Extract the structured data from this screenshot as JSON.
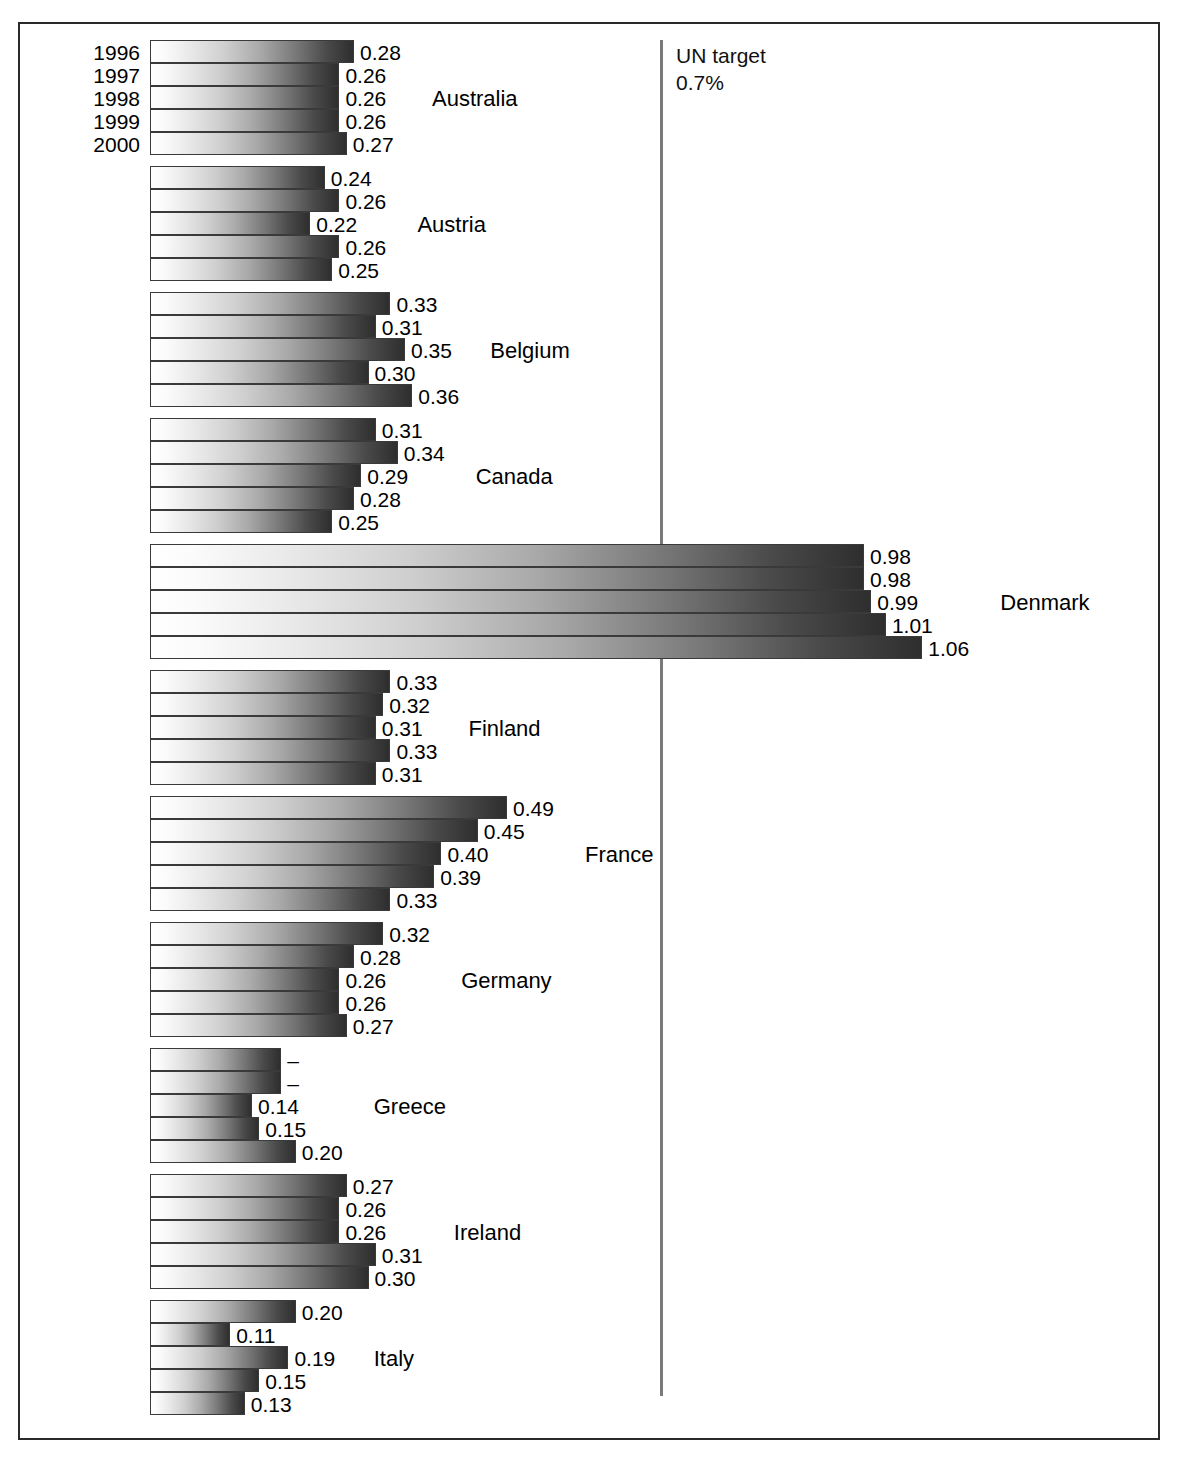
{
  "chart_data": {
    "type": "bar",
    "orientation": "horizontal",
    "title": "",
    "subtitle": "",
    "xlabel": "",
    "ylabel": "",
    "xlim": [
      0,
      1.15
    ],
    "grid": false,
    "legend": "",
    "series_labels": [
      "1996",
      "1997",
      "1998",
      "1999",
      "2000"
    ],
    "reference_line": {
      "value": 0.7,
      "label_line1": "UN target",
      "label_line2": "0.7%",
      "color": "#7a7a7a"
    },
    "categories": [
      "Australia",
      "Austria",
      "Belgium",
      "Canada",
      "Denmark",
      "Finland",
      "France",
      "Germany",
      "Greece",
      "Ireland",
      "Italy"
    ],
    "groups": [
      {
        "country": "Australia",
        "bars": [
          {
            "year": "1996",
            "value": 0.28,
            "label": "0.28"
          },
          {
            "year": "1997",
            "value": 0.26,
            "label": "0.26"
          },
          {
            "year": "1998",
            "value": 0.26,
            "label": "0.26"
          },
          {
            "year": "1999",
            "value": 0.26,
            "label": "0.26"
          },
          {
            "year": "2000",
            "value": 0.27,
            "label": "0.27"
          }
        ]
      },
      {
        "country": "Austria",
        "bars": [
          {
            "year": "1996",
            "value": 0.24,
            "label": "0.24"
          },
          {
            "year": "1997",
            "value": 0.26,
            "label": "0.26"
          },
          {
            "year": "1998",
            "value": 0.22,
            "label": "0.22"
          },
          {
            "year": "1999",
            "value": 0.26,
            "label": "0.26"
          },
          {
            "year": "2000",
            "value": 0.25,
            "label": "0.25"
          }
        ]
      },
      {
        "country": "Belgium",
        "bars": [
          {
            "year": "1996",
            "value": 0.33,
            "label": "0.33"
          },
          {
            "year": "1997",
            "value": 0.31,
            "label": "0.31"
          },
          {
            "year": "1998",
            "value": 0.35,
            "label": "0.35"
          },
          {
            "year": "1999",
            "value": 0.3,
            "label": "0.30"
          },
          {
            "year": "2000",
            "value": 0.36,
            "label": "0.36"
          }
        ]
      },
      {
        "country": "Canada",
        "bars": [
          {
            "year": "1996",
            "value": 0.31,
            "label": "0.31"
          },
          {
            "year": "1997",
            "value": 0.34,
            "label": "0.34"
          },
          {
            "year": "1998",
            "value": 0.29,
            "label": "0.29"
          },
          {
            "year": "1999",
            "value": 0.28,
            "label": "0.28"
          },
          {
            "year": "2000",
            "value": 0.25,
            "label": "0.25"
          }
        ]
      },
      {
        "country": "Denmark",
        "bars": [
          {
            "year": "1996",
            "value": 0.98,
            "label": "0.98"
          },
          {
            "year": "1997",
            "value": 0.98,
            "label": "0.98"
          },
          {
            "year": "1998",
            "value": 0.99,
            "label": "0.99"
          },
          {
            "year": "1999",
            "value": 1.01,
            "label": "1.01"
          },
          {
            "year": "2000",
            "value": 1.06,
            "label": "1.06"
          }
        ]
      },
      {
        "country": "Finland",
        "bars": [
          {
            "year": "1996",
            "value": 0.33,
            "label": "0.33"
          },
          {
            "year": "1997",
            "value": 0.32,
            "label": "0.32"
          },
          {
            "year": "1998",
            "value": 0.31,
            "label": "0.31"
          },
          {
            "year": "1999",
            "value": 0.33,
            "label": "0.33"
          },
          {
            "year": "2000",
            "value": 0.31,
            "label": "0.31"
          }
        ]
      },
      {
        "country": "France",
        "bars": [
          {
            "year": "1996",
            "value": 0.49,
            "label": "0.49"
          },
          {
            "year": "1997",
            "value": 0.45,
            "label": "0.45"
          },
          {
            "year": "1998",
            "value": 0.4,
            "label": "0.40"
          },
          {
            "year": "1999",
            "value": 0.39,
            "label": "0.39"
          },
          {
            "year": "2000",
            "value": 0.33,
            "label": "0.33"
          }
        ]
      },
      {
        "country": "Germany",
        "bars": [
          {
            "year": "1996",
            "value": 0.32,
            "label": "0.32"
          },
          {
            "year": "1997",
            "value": 0.28,
            "label": "0.28"
          },
          {
            "year": "1998",
            "value": 0.26,
            "label": "0.26"
          },
          {
            "year": "1999",
            "value": 0.26,
            "label": "0.26"
          },
          {
            "year": "2000",
            "value": 0.27,
            "label": "0.27"
          }
        ]
      },
      {
        "country": "Greece",
        "bars": [
          {
            "year": "1996",
            "value": 0.18,
            "label": "–"
          },
          {
            "year": "1997",
            "value": 0.18,
            "label": "–"
          },
          {
            "year": "1998",
            "value": 0.14,
            "label": "0.14"
          },
          {
            "year": "1999",
            "value": 0.15,
            "label": "0.15"
          },
          {
            "year": "2000",
            "value": 0.2,
            "label": "0.20"
          }
        ]
      },
      {
        "country": "Ireland",
        "bars": [
          {
            "year": "1996",
            "value": 0.27,
            "label": "0.27"
          },
          {
            "year": "1997",
            "value": 0.26,
            "label": "0.26"
          },
          {
            "year": "1998",
            "value": 0.26,
            "label": "0.26"
          },
          {
            "year": "1999",
            "value": 0.31,
            "label": "0.31"
          },
          {
            "year": "2000",
            "value": 0.3,
            "label": "0.30"
          }
        ]
      },
      {
        "country": "Italy",
        "bars": [
          {
            "year": "1996",
            "value": 0.2,
            "label": "0.20"
          },
          {
            "year": "1997",
            "value": 0.11,
            "label": "0.11"
          },
          {
            "year": "1998",
            "value": 0.19,
            "label": "0.19"
          },
          {
            "year": "1999",
            "value": 0.15,
            "label": "0.15"
          },
          {
            "year": "2000",
            "value": 0.13,
            "label": "0.13"
          }
        ]
      }
    ]
  },
  "layout": {
    "origin_x": 150,
    "scale_px_per_unit": 728.6,
    "first_group_top": 40,
    "bar_height": 23,
    "group_pitch": 126,
    "value_gap": 6,
    "country_label_gap": 30,
    "year_labels_visible_for_group": 0,
    "reference_line_x": 660,
    "reference_line_top": 40,
    "reference_line_bottom": 1396
  }
}
